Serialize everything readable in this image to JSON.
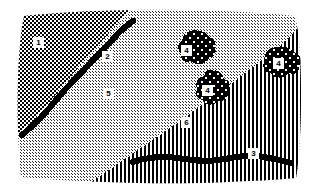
{
  "figure": {
    "kind": "patterned-region-map",
    "width": 314,
    "height": 194,
    "background_color": "#ffffff",
    "ink_color": "#000000"
  },
  "regions": [
    {
      "id": "region-1",
      "label": "1",
      "pattern": "dense-checkerboard",
      "description": "dark dense checkered fill, upper-left area",
      "label_x": 38,
      "label_y": 42
    },
    {
      "id": "region-2",
      "label": "2",
      "pattern": "light-checkerboard",
      "description": "light fine checkered fill, right of the diagonal black curve",
      "label_x": 107,
      "label_y": 56
    },
    {
      "id": "region-5",
      "label": "5",
      "pattern": "light-checkerboard",
      "description": "light fine checkered fill, central lower-left area",
      "label_x": 108,
      "label_y": 93
    },
    {
      "id": "region-6",
      "label": "6",
      "pattern": "vertical-stripes",
      "description": "vertical black line ruling, lower-right wedge",
      "label_x": 186,
      "label_y": 122
    }
  ],
  "line_features": [
    {
      "id": "line-2",
      "label": "2",
      "description": "thick black sinuous line running diagonally from lower-left to upper-right, boundary of region 1",
      "label_x": 107,
      "label_y": 56
    },
    {
      "id": "line-3",
      "label": "3",
      "description": "thick black wavy line running horizontally across the lower striped region",
      "label_x": 253,
      "label_y": 153
    }
  ],
  "blob_features": [
    {
      "id": "blob-4-a",
      "label": "4",
      "pattern": "coarse-dotted-blob",
      "description": "coarse checkered patch in upper-middle-right",
      "label_x": 186,
      "label_y": 50
    },
    {
      "id": "blob-4-b",
      "label": "4",
      "pattern": "coarse-dotted-blob",
      "description": "coarse checkered patch straddling the region 5 / region 6 boundary",
      "label_x": 207,
      "label_y": 90
    },
    {
      "id": "blob-4-c",
      "label": "4",
      "pattern": "coarse-dotted-blob",
      "description": "coarse checkered patch in the upper-right striped region",
      "label_x": 278,
      "label_y": 63
    }
  ],
  "legend_numbers": [
    "1",
    "2",
    "3",
    "4",
    "5",
    "6"
  ]
}
